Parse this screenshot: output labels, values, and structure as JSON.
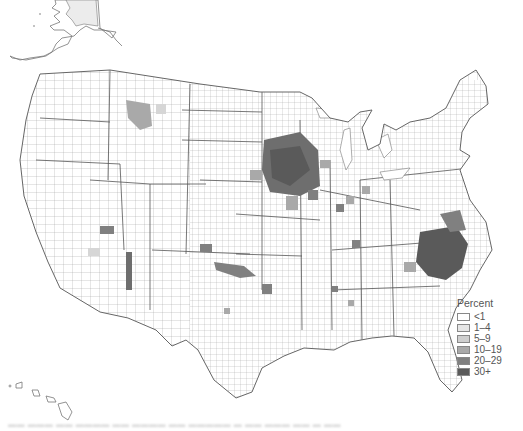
{
  "map": {
    "type": "choropleth",
    "subject": "US counties shaded by percent",
    "regions_shown": [
      "Contiguous United States",
      "Alaska (inset, partial)",
      "Hawaii (inset)"
    ],
    "high_concentration_areas": [
      "Iowa / southern Minnesota",
      "eastern North Carolina / southern Virginia",
      "Oklahoma-Kansas strip",
      "northern Montana",
      "central Arizona (single county)"
    ]
  },
  "legend": {
    "title": "Percent",
    "items": [
      {
        "label": "<1",
        "color": "#ffffff"
      },
      {
        "label": "1–4",
        "color": "#e6e6e6"
      },
      {
        "label": "5–9",
        "color": "#cfcfcf"
      },
      {
        "label": "10–19",
        "color": "#a9a9a9"
      },
      {
        "label": "20–29",
        "color": "#808080"
      },
      {
        "label": "30+",
        "color": "#5a5a5a"
      }
    ]
  },
  "caption": {
    "text": "                                                                          "
  },
  "colors": {
    "border": "#7a7a7a",
    "background": "#ffffff",
    "alaska_fill": "#ececec"
  }
}
